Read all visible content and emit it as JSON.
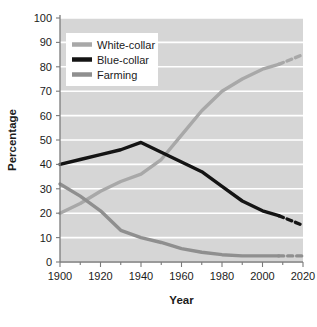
{
  "chart_data": {
    "type": "line",
    "title": "",
    "xlabel": "Year",
    "ylabel": "Percentage",
    "xlim": [
      1900,
      2020
    ],
    "ylim": [
      0,
      100
    ],
    "xticks": [
      1900,
      1920,
      1940,
      1960,
      1980,
      2000,
      2020
    ],
    "xtick_labels": [
      "1900",
      "1920",
      "1940",
      "1960",
      "1980",
      "2000",
      "2020"
    ],
    "xminor_ticks": [
      1910,
      1930,
      1950,
      1970,
      1990,
      2010
    ],
    "yticks": [
      0,
      10,
      20,
      30,
      40,
      50,
      60,
      70,
      80,
      90,
      100
    ],
    "ytick_labels": [
      "0",
      "10",
      "20",
      "30",
      "40",
      "50",
      "60",
      "70",
      "80",
      "90",
      "100"
    ],
    "grid": "horizontal",
    "legend_position": "upper-left",
    "series": [
      {
        "name": "White-collar",
        "color": "#a8a8a8",
        "x": [
          1900,
          1910,
          1920,
          1930,
          1940,
          1950,
          1960,
          1970,
          1980,
          1990,
          2000,
          2008
        ],
        "values": [
          20,
          24,
          29,
          33,
          36,
          42,
          52,
          62,
          70,
          75,
          79,
          81
        ],
        "projected_x": [
          2008,
          2014,
          2020
        ],
        "projected_values": [
          81,
          83,
          85
        ]
      },
      {
        "name": "Blue-collar",
        "color": "#141414",
        "x": [
          1900,
          1910,
          1920,
          1930,
          1940,
          1950,
          1960,
          1970,
          1980,
          1990,
          2000,
          2008
        ],
        "values": [
          40,
          42,
          44,
          46,
          49,
          45,
          41,
          37,
          31,
          25,
          21,
          19
        ],
        "projected_x": [
          2008,
          2014,
          2020
        ],
        "projected_values": [
          19,
          17,
          15
        ]
      },
      {
        "name": "Farming",
        "color": "#8f8f8f",
        "x": [
          1900,
          1910,
          1920,
          1930,
          1940,
          1950,
          1960,
          1970,
          1980,
          1990,
          2000,
          2008
        ],
        "values": [
          32,
          27,
          21,
          13,
          10,
          8,
          5.5,
          4,
          3,
          2.5,
          2.5,
          2.5
        ],
        "projected_x": [
          2008,
          2014,
          2020
        ],
        "projected_values": [
          2.5,
          2.5,
          2.5
        ]
      }
    ],
    "legend_entries": [
      {
        "label": "White-collar",
        "color": "#a8a8a8"
      },
      {
        "label": "Blue-collar",
        "color": "#141414"
      },
      {
        "label": "Farming",
        "color": "#8f8f8f"
      }
    ]
  },
  "colors": {
    "plot_background": "#d6d6d6",
    "gridline": "#ffffff",
    "axis": "#7a7a7a",
    "text": "#1b1b1b",
    "page_background": "#ffffff",
    "legend_background": "#ffffff"
  }
}
